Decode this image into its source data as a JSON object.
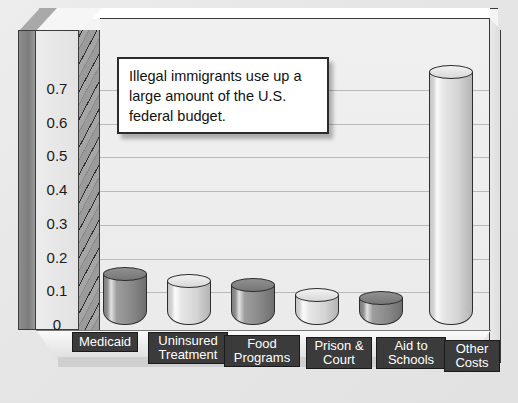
{
  "callout": {
    "text": "Illegal immigrants use up a large amount of the U.S. federal budget."
  },
  "colors": {
    "page_background": "#e9e9e9",
    "plot_background": "#f0f0f0",
    "gridline": "#b9b9b9",
    "frame_outline": "#3a3a3a",
    "label_plate_fill": "#3b3b3b",
    "label_plate_text": "#ffffff",
    "bar_dark": "#8a8a8a",
    "bar_light": "#d8d8d8",
    "callout_border": "#2b2b2b",
    "callout_fill": "#ffffff"
  },
  "chart_data": {
    "type": "bar",
    "title": "",
    "xlabel": "",
    "ylabel": "",
    "grid": true,
    "legend": "none",
    "ylim": [
      0,
      0.8
    ],
    "yticks": [
      "0.7",
      "0.6",
      "0.5",
      "0.4",
      "0.3",
      "0.2",
      "0.1",
      "0"
    ],
    "ytick_values": [
      0.7,
      0.6,
      0.5,
      0.4,
      0.3,
      0.2,
      0.1,
      0
    ],
    "categories": [
      "Medicaid",
      "Uninsured Treatment",
      "Food Programs",
      "Prison & Court",
      "Aid to Schools",
      "Other Costs"
    ],
    "values": [
      0.15,
      0.13,
      0.12,
      0.09,
      0.08,
      0.75
    ],
    "bar_shades": [
      "dark",
      "light",
      "dark",
      "light",
      "dark",
      "light"
    ],
    "annotations": [
      "Illegal immigrants use up a large amount of the U.S. federal budget."
    ]
  }
}
